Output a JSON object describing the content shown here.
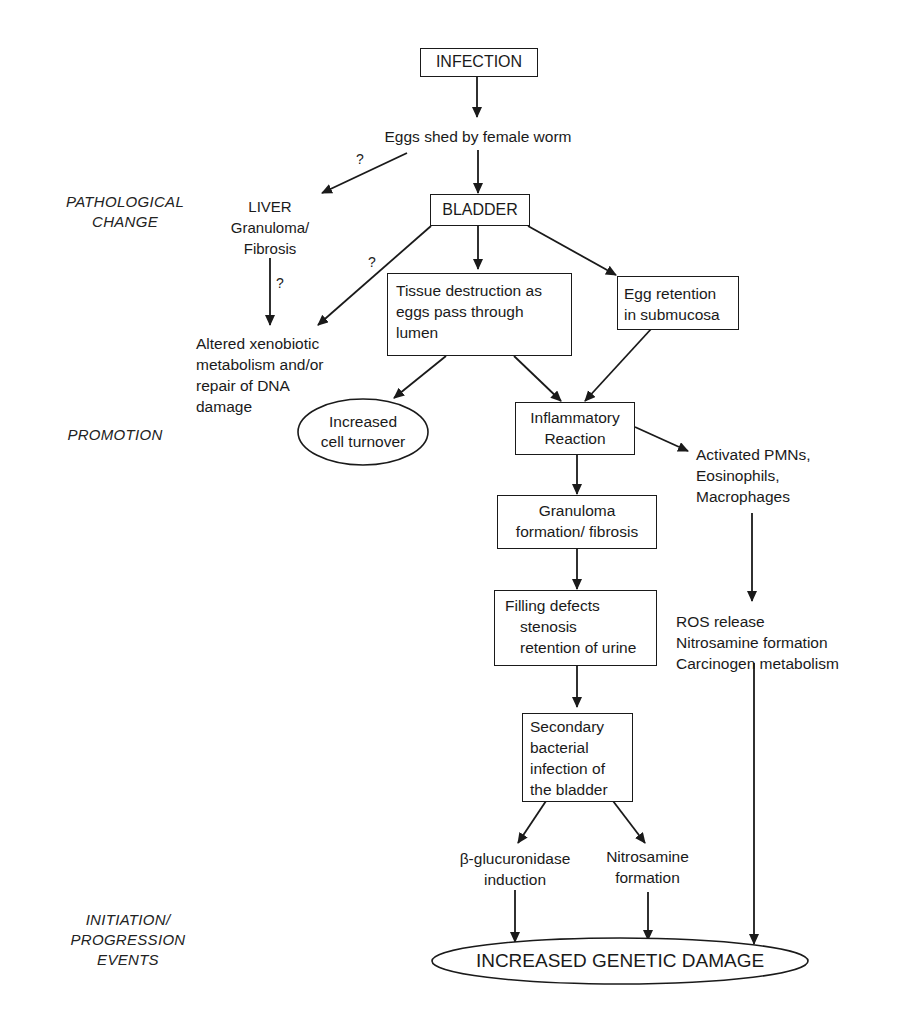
{
  "stages": {
    "pathological_change": [
      "PATHOLOGICAL",
      "CHANGE"
    ],
    "promotion": [
      "PROMOTION"
    ],
    "initiation_progression": [
      "INITIATION/",
      "PROGRESSION",
      "EVENTS"
    ]
  },
  "nodes": {
    "infection": [
      "INFECTION"
    ],
    "eggs_shed": [
      "Eggs shed by female worm"
    ],
    "liver": [
      "LIVER",
      "Granuloma/",
      "Fibrosis"
    ],
    "bladder": [
      "BLADDER"
    ],
    "tissue_destruction": [
      "Tissue destruction as",
      "eggs pass through",
      "lumen"
    ],
    "egg_retention": [
      "Egg retention",
      "in submucosa"
    ],
    "altered_xenobiotic": [
      "Altered xenobiotic",
      "metabolism and/or",
      "repair of DNA",
      "damage"
    ],
    "increased_cell_turnover": [
      "Increased",
      "cell turnover"
    ],
    "inflammatory_reaction": [
      "Inflammatory",
      "Reaction"
    ],
    "activated_cells": [
      "Activated PMNs,",
      "Eosinophils,",
      "Macrophages"
    ],
    "granuloma_formation": [
      "Granuloma",
      "formation/ fibrosis"
    ],
    "filling_defects": [
      "Filling defects",
      "stenosis",
      "retention of urine"
    ],
    "ros_release": [
      "ROS release",
      "Nitrosamine formation",
      "Carcinogen metabolism"
    ],
    "secondary_infection": [
      "Secondary",
      "bacterial",
      "infection of",
      "the bladder"
    ],
    "beta_glucuronidase": [
      "β-glucuronidase",
      "induction"
    ],
    "nitrosamine_formation": [
      "Nitrosamine",
      "formation"
    ],
    "increased_genetic_damage": [
      "INCREASED GENETIC DAMAGE"
    ]
  },
  "question_marks": {
    "eggs_to_liver": "?",
    "liver_to_altered": "?",
    "bladder_to_altered": "?"
  },
  "colors": {
    "ink": "#1a1a1a",
    "background": "#ffffff"
  }
}
